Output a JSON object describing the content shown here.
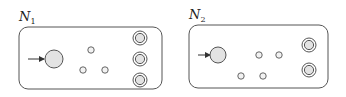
{
  "diagrams": [
    {
      "name": "N",
      "subscript": "1",
      "box": {
        "x": 19,
        "y": 27,
        "w": 143,
        "h": 62,
        "r": 9
      },
      "start_state": {
        "cx": 54,
        "cy": 59,
        "r": 9
      },
      "start_arrow": {
        "x1": 28,
        "x2": 44,
        "y": 59
      },
      "states": [
        {
          "cx": 91,
          "cy": 50,
          "r": 3.2
        },
        {
          "cx": 83,
          "cy": 70,
          "r": 3.2
        },
        {
          "cx": 105,
          "cy": 70,
          "r": 3.2
        }
      ],
      "accept_states": [
        {
          "cx": 140,
          "cy": 38
        },
        {
          "cx": 140,
          "cy": 59
        },
        {
          "cx": 140,
          "cy": 80
        }
      ]
    },
    {
      "name": "N",
      "subscript": "2",
      "box": {
        "x": 189,
        "y": 25,
        "w": 139,
        "h": 63,
        "r": 9
      },
      "start_state": {
        "cx": 218,
        "cy": 55,
        "r": 8
      },
      "start_arrow": {
        "x1": 198,
        "x2": 210,
        "y": 55
      },
      "states": [
        {
          "cx": 259,
          "cy": 55,
          "r": 3.2
        },
        {
          "cx": 279,
          "cy": 55,
          "r": 3.2
        },
        {
          "cx": 241,
          "cy": 76,
          "r": 3.2
        },
        {
          "cx": 263,
          "cy": 76,
          "r": 3.2
        }
      ],
      "accept_states": [
        {
          "cx": 309,
          "cy": 45
        },
        {
          "cx": 309,
          "cy": 70
        }
      ]
    }
  ],
  "colors": {
    "stroke": "#555555",
    "fill": "#e3e3e3",
    "background": "#ffffff"
  }
}
